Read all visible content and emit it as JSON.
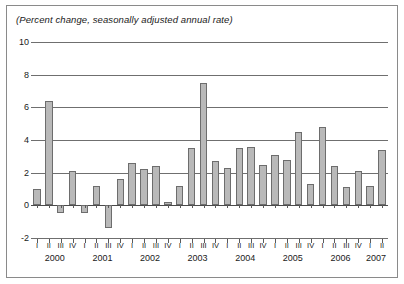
{
  "figure": {
    "title": "(Percent change, seasonally adjusted annual rate)"
  },
  "chart_data": {
    "type": "bar",
    "title": "(Percent change, seasonally adjusted annual rate)",
    "xlabel": "",
    "ylabel": "",
    "ylim": [
      -2,
      10
    ],
    "yticks": [
      -2,
      0,
      2,
      4,
      6,
      8,
      10
    ],
    "ytick_labels": [
      "-2",
      "0",
      "2",
      "4",
      "6",
      "8",
      "10"
    ],
    "grid": true,
    "legend": "none",
    "bar_color": "#b9b9b9",
    "bar_border_color": "#6d6d6d",
    "years": [
      "2000",
      "2001",
      "2002",
      "2003",
      "2004",
      "2005",
      "2006",
      "2007"
    ],
    "quarters": [
      "I",
      "II",
      "III",
      "IV"
    ],
    "categories": [
      "2000 I",
      "2000 II",
      "2000 III",
      "2000 IV",
      "2001 I",
      "2001 II",
      "2001 III",
      "2001 IV",
      "2002 I",
      "2002 II",
      "2002 III",
      "2002 IV",
      "2003 I",
      "2003 II",
      "2003 III",
      "2003 IV",
      "2004 I",
      "2004 II",
      "2004 III",
      "2004 IV",
      "2005 I",
      "2005 II",
      "2005 III",
      "2005 IV",
      "2006 I",
      "2006 II",
      "2006 III",
      "2006 IV",
      "2007 I",
      "2007 II"
    ],
    "values": [
      1.0,
      6.4,
      -0.5,
      2.1,
      -0.5,
      1.2,
      -1.4,
      1.6,
      2.6,
      2.2,
      2.4,
      0.2,
      1.2,
      3.5,
      7.5,
      2.7,
      2.3,
      3.5,
      3.6,
      2.5,
      3.1,
      2.8,
      4.5,
      1.3,
      4.8,
      2.4,
      1.1,
      2.1,
      1.2,
      3.4
    ]
  }
}
